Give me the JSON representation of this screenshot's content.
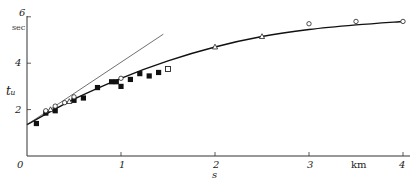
{
  "chart_data": {
    "type": "scatter",
    "title": "",
    "xlabel": "s",
    "x_unit": "km",
    "ylabel": "t_u",
    "y_unit": "sec",
    "xlim": [
      0,
      4.1
    ],
    "ylim": [
      0,
      6
    ],
    "x_ticks": [
      "0",
      "1",
      "2",
      "3",
      "4"
    ],
    "y_ticks": [
      "2",
      "4",
      "6"
    ],
    "grid": false,
    "series": [
      {
        "name": "filled squares",
        "marker": "filled-square",
        "x": [
          0.1,
          0.2,
          0.3,
          0.5,
          0.6,
          0.75,
          0.9,
          0.95,
          1.0,
          1.1,
          1.2,
          1.3,
          1.4
        ],
        "y": [
          1.4,
          1.85,
          1.95,
          2.4,
          2.5,
          2.95,
          3.2,
          3.2,
          3.0,
          3.3,
          3.55,
          3.45,
          3.6
        ]
      },
      {
        "name": "open circles",
        "marker": "open-circle",
        "x": [
          0.2,
          0.3,
          0.4,
          0.5,
          1.0,
          3.0,
          3.5,
          4.0
        ],
        "y": [
          1.95,
          2.15,
          2.3,
          2.55,
          3.35,
          5.7,
          5.8,
          5.8
        ]
      },
      {
        "name": "open squares",
        "marker": "open-square",
        "x": [
          1.5
        ],
        "y": [
          3.75
        ]
      },
      {
        "name": "open triangles",
        "marker": "open-triangle",
        "x": [
          0.25,
          0.45,
          2.0,
          2.5
        ],
        "y": [
          2.0,
          2.35,
          4.7,
          5.15
        ]
      },
      {
        "name": "fitted curve",
        "marker": "line",
        "x": [
          0,
          0.5,
          1.0,
          1.5,
          2.0,
          2.5,
          3.0,
          3.5,
          4.0
        ],
        "y": [
          1.35,
          2.45,
          3.35,
          4.1,
          4.7,
          5.15,
          5.45,
          5.65,
          5.8
        ]
      },
      {
        "name": "tangent line",
        "marker": "thin-line",
        "x": [
          0,
          1.45
        ],
        "y": [
          1.35,
          5.25
        ]
      }
    ]
  },
  "axes": {
    "y_label": "tᵤ",
    "y_unit": "sec",
    "x_label": "s",
    "x_unit": "km",
    "origin": "0",
    "y_tick_labels": [
      "2",
      "4",
      "6"
    ],
    "x_tick_labels": [
      "1",
      "2",
      "3",
      "4"
    ]
  }
}
